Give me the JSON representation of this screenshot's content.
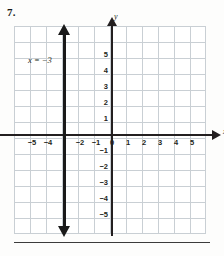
{
  "problem": {
    "number": "7."
  },
  "graph": {
    "equation_label": "x = −3",
    "axis_labels": {
      "x": "x",
      "y": "y"
    },
    "x_ticks": [
      {
        "value": -5,
        "label": "−5"
      },
      {
        "value": -4,
        "label": "−4"
      },
      {
        "value": -2,
        "label": "−2"
      },
      {
        "value": -1,
        "label": "−1"
      },
      {
        "value": 0,
        "label": "0"
      },
      {
        "value": 1,
        "label": "1"
      },
      {
        "value": 2,
        "label": "2"
      },
      {
        "value": 3,
        "label": "3"
      },
      {
        "value": 4,
        "label": "4"
      },
      {
        "value": 5,
        "label": "5"
      }
    ],
    "y_ticks": [
      {
        "value": 5,
        "label": "5"
      },
      {
        "value": 4,
        "label": "4"
      },
      {
        "value": 3,
        "label": "3"
      },
      {
        "value": 2,
        "label": "2"
      },
      {
        "value": 1,
        "label": "1"
      },
      {
        "value": -1,
        "label": "−1"
      },
      {
        "value": -2,
        "label": "−2"
      },
      {
        "value": -3,
        "label": "−3"
      },
      {
        "value": -4,
        "label": "−4"
      },
      {
        "value": -5,
        "label": "−5"
      }
    ]
  },
  "chart_data": {
    "type": "line",
    "title": "",
    "xlabel": "x",
    "ylabel": "y",
    "xlim": [
      -6,
      6
    ],
    "ylim": [
      -6,
      6
    ],
    "grid": true,
    "legend": "none",
    "annotations": [
      {
        "text": "x = −3",
        "x": -5.2,
        "y": 4.3
      }
    ],
    "series": [
      {
        "name": "x = −3",
        "equation": "x = -3",
        "kind": "vertical-line",
        "x_intercept": -3,
        "points": [
          [
            -3,
            -6
          ],
          [
            -3,
            6
          ]
        ],
        "color": "#1a1a1a",
        "arrows": "both"
      }
    ],
    "categories": [],
    "values": []
  }
}
